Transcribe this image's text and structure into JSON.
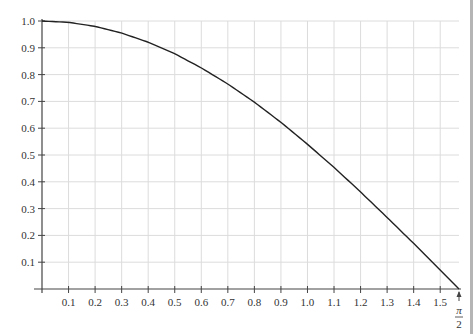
{
  "chart_data": {
    "type": "line",
    "title": "",
    "xlabel": "",
    "ylabel": "",
    "xlim": [
      0,
      1.5708
    ],
    "ylim": [
      0,
      1.0
    ],
    "grid": true,
    "x_ticks": [
      "0.1",
      "0.2",
      "0.3",
      "0.4",
      "0.5",
      "0.6",
      "0.7",
      "0.8",
      "0.9",
      "1.0",
      "1.1",
      "1.2",
      "1.3",
      "1.4",
      "1.5"
    ],
    "x_end_label": {
      "numerator": "π",
      "denominator": "2"
    },
    "y_ticks": [
      "0.1",
      "0.2",
      "0.3",
      "0.4",
      "0.5",
      "0.6",
      "0.7",
      "0.8",
      "0.9",
      "1.0"
    ],
    "series": [
      {
        "name": "cos(x)",
        "x": [
          0,
          0.1,
          0.2,
          0.3,
          0.4,
          0.5,
          0.6,
          0.7,
          0.8,
          0.9,
          1.0,
          1.1,
          1.2,
          1.3,
          1.4,
          1.5,
          1.5708
        ],
        "values": [
          1.0,
          0.995,
          0.98,
          0.955,
          0.921,
          0.878,
          0.825,
          0.765,
          0.697,
          0.622,
          0.54,
          0.454,
          0.362,
          0.267,
          0.17,
          0.071,
          0.0
        ],
        "color": "#222222"
      }
    ]
  },
  "colors": {
    "grid": "#dcdcdc",
    "axis": "#444444",
    "curve": "#222222",
    "edge": "#b5b5b5"
  }
}
